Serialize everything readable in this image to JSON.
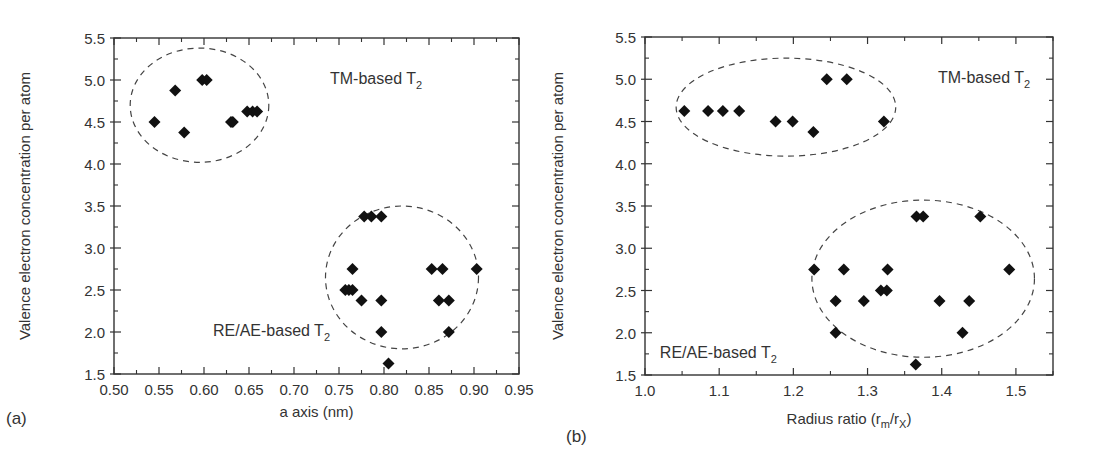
{
  "chart_data": [
    {
      "panel_label": "(a)",
      "type": "scatter",
      "title": "",
      "xlabel": "a axis (nm)",
      "ylabel": "Valence electron concentration per atom",
      "xlim": [
        0.5,
        0.95
      ],
      "ylim": [
        1.5,
        5.5
      ],
      "x_ticks": [
        "0.50",
        "0.55",
        "0.60",
        "0.65",
        "0.70",
        "0.75",
        "0.80",
        "0.85",
        "0.90",
        "0.95"
      ],
      "y_ticks": [
        "1.5",
        "2.0",
        "2.5",
        "3.0",
        "3.5",
        "4.0",
        "4.5",
        "5.0",
        "5.5"
      ],
      "grid": false,
      "marker": "diamond",
      "series": [
        {
          "name": "TM-based T2",
          "points": [
            [
              0.545,
              4.5
            ],
            [
              0.568,
              4.875
            ],
            [
              0.578,
              4.375
            ],
            [
              0.598,
              5.0
            ],
            [
              0.603,
              5.0
            ],
            [
              0.63,
              4.5
            ],
            [
              0.632,
              4.5
            ],
            [
              0.648,
              4.625
            ],
            [
              0.654,
              4.625
            ],
            [
              0.659,
              4.625
            ]
          ]
        },
        {
          "name": "RE/AE-based T2",
          "points": [
            [
              0.778,
              3.375
            ],
            [
              0.786,
              3.375
            ],
            [
              0.797,
              3.375
            ],
            [
              0.765,
              2.75
            ],
            [
              0.757,
              2.5
            ],
            [
              0.761,
              2.5
            ],
            [
              0.765,
              2.5
            ],
            [
              0.775,
              2.375
            ],
            [
              0.797,
              2.375
            ],
            [
              0.797,
              2.0
            ],
            [
              0.805,
              1.625
            ],
            [
              0.853,
              2.75
            ],
            [
              0.865,
              2.75
            ],
            [
              0.861,
              2.375
            ],
            [
              0.872,
              2.375
            ],
            [
              0.872,
              2.0
            ],
            [
              0.903,
              2.75
            ]
          ]
        }
      ],
      "annotations": [
        {
          "text": "TM-based T",
          "sub": "2",
          "x": 0.74,
          "y": 4.95
        },
        {
          "text": "RE/AE-based T",
          "sub": "2",
          "x": 0.61,
          "y": 1.95
        }
      ],
      "ellipses": [
        {
          "cx": 0.595,
          "cy": 4.7,
          "rx": 0.077,
          "ry": 0.68
        },
        {
          "cx": 0.82,
          "cy": 2.65,
          "rx": 0.085,
          "ry": 0.85
        }
      ]
    },
    {
      "panel_label": "(b)",
      "type": "scatter",
      "title": "",
      "xlabel": "Radius ratio (r",
      "xlabel_sub_m": "m",
      "xlabel_mid": "/r",
      "xlabel_sub_x": "X",
      "xlabel_end": ")",
      "ylabel": "Valence electron concentration per atom",
      "xlim": [
        1.0,
        1.55
      ],
      "ylim": [
        1.5,
        5.5
      ],
      "x_ticks": [
        "1.0",
        "1.1",
        "1.2",
        "1.3",
        "1.4",
        "1.5"
      ],
      "y_ticks": [
        "1.5",
        "2.0",
        "2.5",
        "3.0",
        "3.5",
        "4.0",
        "4.5",
        "5.0",
        "5.5"
      ],
      "grid": false,
      "marker": "diamond",
      "series": [
        {
          "name": "TM-based T2",
          "points": [
            [
              1.053,
              4.625
            ],
            [
              1.085,
              4.625
            ],
            [
              1.105,
              4.625
            ],
            [
              1.127,
              4.625
            ],
            [
              1.176,
              4.5
            ],
            [
              1.199,
              4.5
            ],
            [
              1.227,
              4.375
            ],
            [
              1.245,
              5.0
            ],
            [
              1.272,
              5.0
            ],
            [
              1.322,
              4.5
            ]
          ]
        },
        {
          "name": "RE/AE-based T2",
          "points": [
            [
              1.228,
              2.75
            ],
            [
              1.268,
              2.75
            ],
            [
              1.327,
              2.75
            ],
            [
              1.491,
              2.75
            ],
            [
              1.257,
              2.375
            ],
            [
              1.295,
              2.375
            ],
            [
              1.397,
              2.375
            ],
            [
              1.437,
              2.375
            ],
            [
              1.318,
              2.5
            ],
            [
              1.326,
              2.5
            ],
            [
              1.257,
              2.0
            ],
            [
              1.428,
              2.0
            ],
            [
              1.366,
              3.375
            ],
            [
              1.375,
              3.375
            ],
            [
              1.452,
              3.375
            ],
            [
              1.365,
              1.625
            ]
          ]
        }
      ],
      "annotations": [
        {
          "text": "TM-based T",
          "sub": "2",
          "x": 1.395,
          "y": 4.95
        },
        {
          "text": "RE/AE-based T",
          "sub": "2",
          "x": 1.02,
          "y": 1.7
        }
      ],
      "ellipses": [
        {
          "cx": 1.19,
          "cy": 4.67,
          "rx": 0.148,
          "ry": 0.58
        },
        {
          "cx": 1.375,
          "cy": 2.64,
          "rx": 0.15,
          "ry": 0.93
        }
      ]
    }
  ]
}
